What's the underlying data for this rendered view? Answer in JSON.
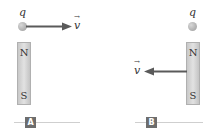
{
  "panels": [
    {
      "id": "A",
      "label": "A",
      "charge_label": "q",
      "velocity_label": "v",
      "velocity_direction": "right",
      "magnet": {
        "top_pole": "N",
        "bottom_pole": "S"
      }
    },
    {
      "id": "B",
      "label": "B",
      "charge_label": "q",
      "velocity_label": "v",
      "velocity_direction": "left",
      "magnet": {
        "top_pole": "N",
        "bottom_pole": "S"
      }
    }
  ],
  "colors": {
    "arrow": "#5a5a5a",
    "magnet": "#d4d4d4",
    "badge": "#6d6d6d"
  }
}
